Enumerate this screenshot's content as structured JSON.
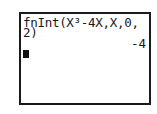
{
  "calculator": {
    "entry_line_1": "fnInt(X³-4X,X,0,",
    "entry_line_2": "2)",
    "result": "-4",
    "cursor": "block-cursor"
  }
}
